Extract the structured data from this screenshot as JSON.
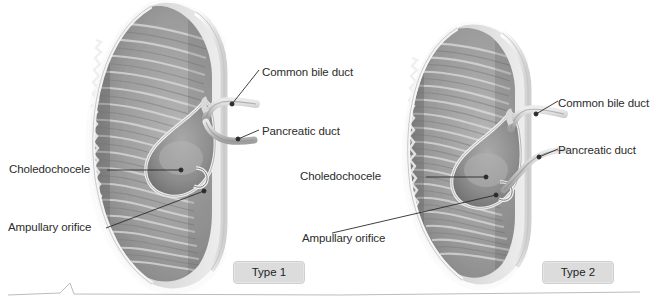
{
  "figure": {
    "background_color": "#ffffff",
    "line_color": "#2b2b2b",
    "text_color": "#2c2c2c",
    "badge_fill": "#dcdcdc",
    "badge_border": "#cfcfcf"
  },
  "panels": [
    {
      "id": "type1",
      "badge_label": "Type 1",
      "labels": {
        "common_bile_duct": "Common bile duct",
        "pancreatic_duct": "Pancreatic duct",
        "choledochocele": "Choledochocele",
        "ampullary_orifice": "Ampullary orifice"
      },
      "structures": [
        "duodenal-wall",
        "duodenal-mucosal-folds",
        "choledochocele-cyst",
        "common-bile-duct",
        "pancreatic-duct",
        "ampullary-orifice"
      ]
    },
    {
      "id": "type2",
      "badge_label": "Type 2",
      "labels": {
        "common_bile_duct": "Common bile duct",
        "pancreatic_duct": "Pancreatic duct",
        "choledochocele": "Choledochocele",
        "ampullary_orifice": "Ampullary orifice"
      },
      "structures": [
        "duodenal-wall",
        "duodenal-mucosal-folds",
        "choledochocele-cyst",
        "common-bile-duct",
        "pancreatic-duct",
        "ampullary-orifice"
      ]
    }
  ],
  "footer": {
    "rule_note": ""
  }
}
